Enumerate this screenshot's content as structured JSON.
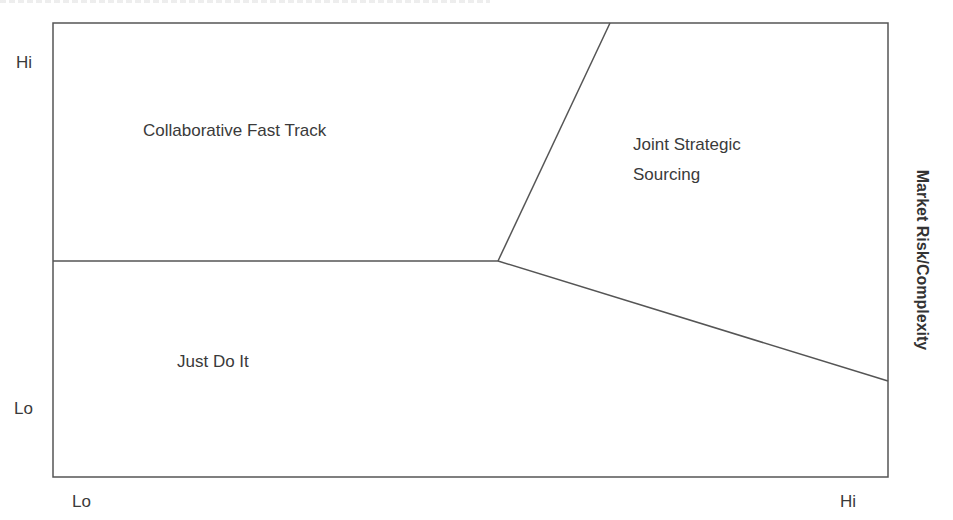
{
  "diagram": {
    "y_axis": {
      "title": "Market Risk/Complexity",
      "hi_label": "Hi",
      "lo_label": "Lo"
    },
    "x_axis": {
      "lo_label": "Lo",
      "hi_label": "Hi"
    },
    "regions": {
      "collaborative": "Collaborative Fast Track",
      "joint_line1": "Joint Strategic",
      "joint_line2": "Sourcing",
      "just_do_it": "Just Do It"
    },
    "colors": {
      "line": "#555555",
      "text": "#3a3a3a"
    }
  }
}
